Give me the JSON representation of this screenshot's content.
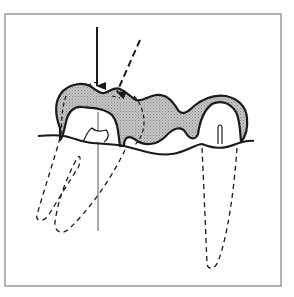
{
  "diagram": {
    "colors": {
      "background": "#ffffff",
      "frame": "#9a9a9a",
      "stroke": "#1a1a1a",
      "fill": "#bdbdbd",
      "thin_line": "#555555"
    },
    "frame": {
      "x": 5,
      "y": 14,
      "width": 276,
      "height": 272
    },
    "arrows": [
      {
        "name": "solid-load-arrow",
        "style": "solid",
        "from": [
          97,
          27
        ],
        "to": [
          97,
          86
        ]
      },
      {
        "name": "dashed-load-arrow",
        "style": "dashed",
        "from": [
          140,
          40
        ],
        "to": [
          117,
          92
        ]
      }
    ],
    "reference_line": {
      "x": 98,
      "y1": 112,
      "y2": 231
    },
    "elements": [
      "bridge-crown (shaded)",
      "gum-line",
      "left-abutment-roots (dashed)",
      "right-abutment-root (dashed)",
      "pontic",
      "pulp-chambers"
    ]
  }
}
